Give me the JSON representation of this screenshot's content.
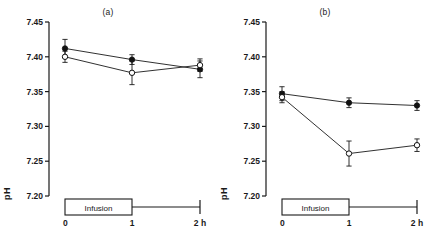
{
  "figure": {
    "axis_label_y": "pH",
    "panels": [
      {
        "id": "a",
        "label": "(a)",
        "infusion_label": "Infusion",
        "y_ticks": [
          "7.45",
          "7.40",
          "7.35",
          "7.30",
          "7.25",
          "7.20"
        ],
        "x_ticks": [
          "0",
          "1",
          "2 h"
        ]
      },
      {
        "id": "b",
        "label": "(b)",
        "infusion_label": "Infusion",
        "y_ticks": [
          "7.45",
          "7.40",
          "7.35",
          "7.30",
          "7.25",
          "7.20"
        ],
        "x_ticks": [
          "0",
          "1",
          "2 h"
        ]
      }
    ]
  },
  "chart_data": [
    {
      "type": "line",
      "title": "(a)",
      "xlabel": "2 h",
      "ylabel": "pH",
      "x": [
        0,
        1,
        2
      ],
      "x_tick_labels": [
        "0",
        "1",
        "2 h"
      ],
      "ylim": [
        7.2,
        7.45
      ],
      "y_ticks": [
        7.45,
        7.4,
        7.35,
        7.3,
        7.25,
        7.2
      ],
      "xlim": [
        0,
        2
      ],
      "grid": false,
      "legend": "none",
      "annotations": [
        "Infusion"
      ],
      "series": [
        {
          "name": "filled-circle",
          "marker": "filled circle",
          "values": [
            7.412,
            7.396,
            7.382
          ],
          "errors": [
            0.013,
            0.007,
            0.012
          ]
        },
        {
          "name": "open-circle",
          "marker": "open circle",
          "values": [
            7.4,
            7.377,
            7.388
          ],
          "errors": [
            0.008,
            0.017,
            0.009
          ]
        }
      ]
    },
    {
      "type": "line",
      "title": "(b)",
      "xlabel": "2 h",
      "ylabel": "pH",
      "x": [
        0,
        1,
        2
      ],
      "x_tick_labels": [
        "0",
        "1",
        "2 h"
      ],
      "ylim": [
        7.2,
        7.45
      ],
      "y_ticks": [
        7.45,
        7.4,
        7.35,
        7.3,
        7.25,
        7.2
      ],
      "xlim": [
        0,
        2
      ],
      "grid": false,
      "legend": "none",
      "annotations": [
        "Infusion"
      ],
      "series": [
        {
          "name": "filled-circle",
          "marker": "filled circle",
          "values": [
            7.347,
            7.334,
            7.33
          ],
          "errors": [
            0.01,
            0.007,
            0.007
          ]
        },
        {
          "name": "open-circle",
          "marker": "open circle",
          "values": [
            7.342,
            7.261,
            7.273
          ],
          "errors": [
            0.008,
            0.018,
            0.009
          ]
        }
      ]
    }
  ]
}
